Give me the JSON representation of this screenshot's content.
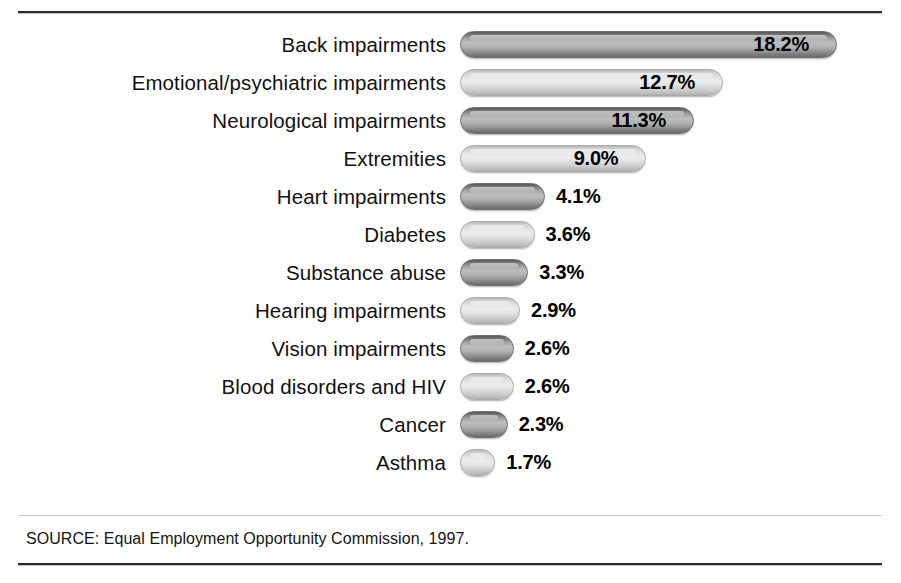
{
  "figure": {
    "source_note": "SOURCE: Equal Employment Opportunity Commission, 1997."
  },
  "chart_data": {
    "type": "bar",
    "orientation": "horizontal",
    "title": "",
    "subtitle": "",
    "xlabel": "",
    "ylabel": "",
    "xlim": [
      0,
      18.2
    ],
    "grid": false,
    "legend": "none",
    "value_suffix": "%",
    "categories": [
      "Back impairments",
      "Emotional/psychiatric impairments",
      "Neurological impairments",
      "Extremities",
      "Heart impairments",
      "Diabetes",
      "Substance abuse",
      "Hearing impairments",
      "Vision impairments",
      "Blood disorders and HIV",
      "Cancer",
      "Asthma"
    ],
    "values": [
      18.2,
      12.7,
      11.3,
      9.0,
      4.1,
      3.6,
      3.3,
      2.9,
      2.6,
      2.6,
      2.3,
      1.7
    ],
    "value_labels": [
      "18.2%",
      "12.7%",
      "11.3%",
      "9.0%",
      "4.1%",
      "3.6%",
      "3.3%",
      "2.9%",
      "2.6%",
      "2.6%",
      "2.3%",
      "1.7%"
    ],
    "label_placement": [
      "inside",
      "inside",
      "inside",
      "inside",
      "outside",
      "outside",
      "outside",
      "outside",
      "outside",
      "outside",
      "outside",
      "outside"
    ],
    "bar_shades": [
      "dark",
      "light",
      "dark",
      "light",
      "dark",
      "light",
      "dark",
      "light",
      "dark",
      "light",
      "dark",
      "light"
    ],
    "colors": {
      "bar_dark_top": "#585858",
      "bar_dark_mid": "#bdbdbd",
      "bar_light_top": "#b9b9b9",
      "bar_light_mid": "#ececec",
      "text": "#111111",
      "rule": "#2b2b2b",
      "background": "#ffffff"
    }
  }
}
